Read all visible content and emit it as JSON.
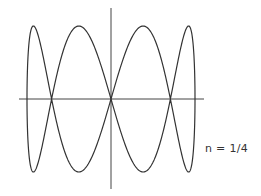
{
  "chart_data": {
    "type": "line",
    "title": "",
    "annotation": "n = 1/4",
    "xlabel": "",
    "ylabel": "",
    "grid": false,
    "legend": null,
    "parametric": {
      "x": "sin(t)",
      "y": "sin(4t)",
      "t_range": [
        0,
        6.2832
      ],
      "frequency_ratio": "1/4"
    },
    "xlim": [
      -1,
      1
    ],
    "ylim": [
      -1,
      1
    ],
    "x_axis_crossings": [
      -0.707,
      0,
      0.707
    ],
    "peaks": [
      {
        "x": -0.924,
        "y": 1
      },
      {
        "x": -0.383,
        "y": 1
      },
      {
        "x": 0.383,
        "y": 1
      },
      {
        "x": 0.924,
        "y": 1
      }
    ],
    "troughs": [
      {
        "x": -0.924,
        "y": -1
      },
      {
        "x": -0.383,
        "y": -1
      },
      {
        "x": 0.383,
        "y": -1
      },
      {
        "x": 0.924,
        "y": -1
      }
    ]
  },
  "style": {
    "line_color": "#333333",
    "axis_color": "#444444",
    "background": "#ffffff"
  },
  "layout": {
    "cx": 111,
    "cy": 99,
    "ax": 84,
    "ay": 73,
    "haxis": [
      19,
      204
    ],
    "vaxis": [
      8,
      189
    ]
  }
}
